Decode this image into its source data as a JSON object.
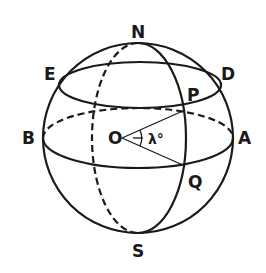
{
  "diagram": {
    "title": "",
    "colors": {
      "stroke": "#1a1a1a",
      "background": "#ffffff"
    },
    "labels": {
      "north_pole": "N",
      "south_pole": "S",
      "east_point": "E",
      "d_point": "D",
      "p_point": "P",
      "q_point": "Q",
      "b_point": "B",
      "a_point": "A",
      "center": "O",
      "angle": "λ°"
    },
    "elements": [
      "outer-circle",
      "equator-ellipse (front solid, back dashed)",
      "parallel-ellipse E-D (solid)",
      "meridian-ellipse N-S (front solid, back dashed)",
      "radius OP",
      "radius OQ",
      "angle-arc lambda at O"
    ]
  }
}
